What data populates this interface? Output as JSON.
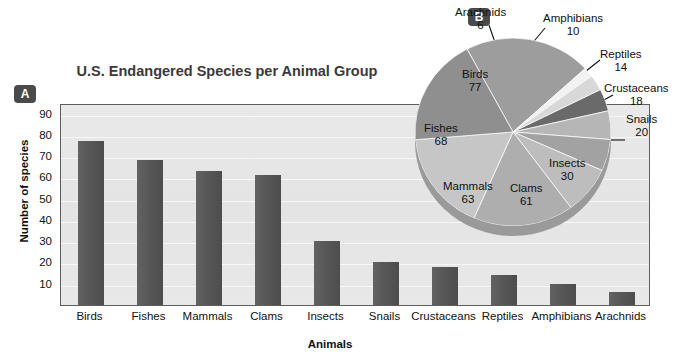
{
  "panels": {
    "a_badge": "A",
    "b_badge": "B"
  },
  "bar_panel": {
    "title": "U.S. Endangered Species per Animal Group",
    "ylabel": "Number of species",
    "xlabel": "Animals"
  },
  "chart_data": [
    {
      "type": "bar",
      "title": "U.S. Endangered Species per Animal Group",
      "xlabel": "Animals",
      "ylabel": "Number of species",
      "categories": [
        "Birds",
        "Fishes",
        "Mammals",
        "Clams",
        "Insects",
        "Snails",
        "Crustaceans",
        "Reptiles",
        "Amphibians",
        "Arachnids"
      ],
      "values": [
        77,
        68,
        63,
        61,
        30,
        20,
        18,
        14,
        10,
        6
      ],
      "yticks": [
        10,
        20,
        30,
        40,
        50,
        60,
        70,
        80,
        90
      ],
      "ylim": [
        0,
        95
      ],
      "grid": true,
      "legend": "none",
      "bar_color": "#575757",
      "plot_background": "#e7e7e7"
    },
    {
      "type": "pie",
      "title": "",
      "labels": [
        "Birds",
        "Arachnids",
        "Amphibians",
        "Reptiles",
        "Crustaceans",
        "Snails",
        "Insects",
        "Clams",
        "Mammals",
        "Fishes"
      ],
      "values": [
        77,
        6,
        10,
        14,
        18,
        20,
        30,
        61,
        63,
        68
      ],
      "slice_colors": [
        "#9d9d9d",
        "#f2f2f2",
        "#d8d8d8",
        "#6a6a6a",
        "#b6b6b6",
        "#a2a2a2",
        "#bdbdbd",
        "#aeaeae",
        "#c6c6c6",
        "#8f8f8f"
      ],
      "legend": "callout-labels",
      "total": 367
    }
  ],
  "pie_labels": {
    "inside": [
      {
        "name": "Birds",
        "value": "77"
      },
      {
        "name": "Fishes",
        "value": "68"
      },
      {
        "name": "Mammals",
        "value": "63"
      },
      {
        "name": "Clams",
        "value": "61"
      },
      {
        "name": "Insects",
        "value": "30"
      }
    ],
    "outside": [
      {
        "name": "Arachnids",
        "value": "6"
      },
      {
        "name": "Amphibians",
        "value": "10"
      },
      {
        "name": "Reptiles",
        "value": "14"
      },
      {
        "name": "Crustaceans",
        "value": "18"
      },
      {
        "name": "Snails",
        "value": "20"
      }
    ]
  }
}
